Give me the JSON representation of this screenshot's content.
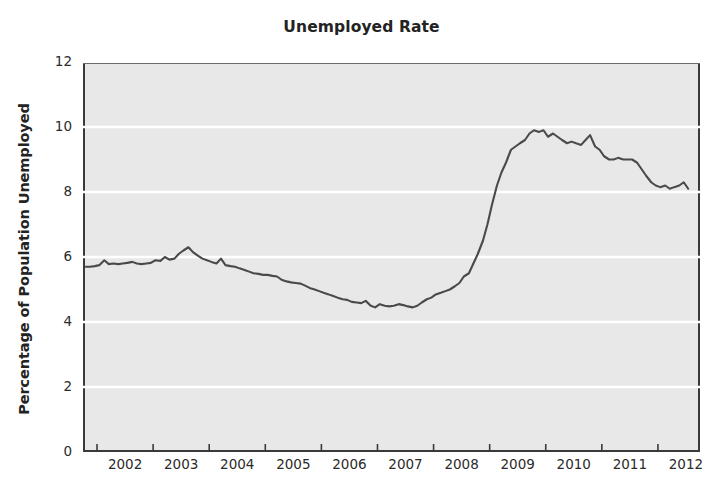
{
  "chart_data": {
    "type": "line",
    "title": "Unemployed Rate",
    "xlabel": "",
    "ylabel": "Percentage of Population Unemployed",
    "xlim": [
      2001.75,
      2012.75
    ],
    "ylim": [
      0,
      12
    ],
    "yticks": [
      0,
      2,
      4,
      6,
      8,
      10,
      12
    ],
    "xticks": [
      2002,
      2003,
      2004,
      2005,
      2006,
      2007,
      2008,
      2009,
      2010,
      2011,
      2012
    ],
    "xtick_labels": [
      "2002",
      "2003",
      "2004",
      "2005",
      "2006",
      "2007",
      "2008",
      "2009",
      "2010",
      "2011",
      "2012"
    ],
    "ytick_labels": [
      "0",
      "2",
      "4",
      "6",
      "8",
      "10",
      "12"
    ],
    "grid": "horizontal-white",
    "legend": "none",
    "plot_background": "#e8e8e8",
    "line_color": "#4a4a4a",
    "border_color": "#3a3a3a",
    "series": [
      {
        "name": "Unemployment rate",
        "x": [
          2001.8,
          2001.88,
          2001.96,
          2002.04,
          2002.13,
          2002.21,
          2002.29,
          2002.38,
          2002.46,
          2002.54,
          2002.63,
          2002.71,
          2002.79,
          2002.88,
          2002.96,
          2003.04,
          2003.13,
          2003.21,
          2003.29,
          2003.38,
          2003.46,
          2003.54,
          2003.63,
          2003.71,
          2003.79,
          2003.88,
          2003.96,
          2004.04,
          2004.13,
          2004.21,
          2004.29,
          2004.38,
          2004.46,
          2004.54,
          2004.63,
          2004.71,
          2004.79,
          2004.88,
          2004.96,
          2005.04,
          2005.13,
          2005.21,
          2005.29,
          2005.38,
          2005.46,
          2005.54,
          2005.63,
          2005.71,
          2005.79,
          2005.88,
          2005.96,
          2006.04,
          2006.13,
          2006.21,
          2006.29,
          2006.38,
          2006.46,
          2006.54,
          2006.63,
          2006.71,
          2006.79,
          2006.88,
          2006.96,
          2007.04,
          2007.13,
          2007.21,
          2007.29,
          2007.38,
          2007.46,
          2007.54,
          2007.63,
          2007.71,
          2007.79,
          2007.88,
          2007.96,
          2008.04,
          2008.13,
          2008.21,
          2008.29,
          2008.38,
          2008.46,
          2008.54,
          2008.63,
          2008.71,
          2008.79,
          2008.88,
          2008.96,
          2009.04,
          2009.13,
          2009.21,
          2009.29,
          2009.38,
          2009.46,
          2009.54,
          2009.63,
          2009.71,
          2009.79,
          2009.88,
          2009.96,
          2010.04,
          2010.13,
          2010.21,
          2010.29,
          2010.38,
          2010.46,
          2010.54,
          2010.63,
          2010.71,
          2010.79,
          2010.88,
          2010.96,
          2011.04,
          2011.13,
          2011.21,
          2011.29,
          2011.38,
          2011.46,
          2011.54,
          2011.63,
          2011.71,
          2011.79,
          2011.88,
          2011.96,
          2012.04,
          2012.13,
          2012.21,
          2012.29,
          2012.38,
          2012.46,
          2012.54
        ],
        "y": [
          5.7,
          5.7,
          5.72,
          5.75,
          5.9,
          5.78,
          5.8,
          5.78,
          5.8,
          5.82,
          5.85,
          5.8,
          5.78,
          5.8,
          5.82,
          5.9,
          5.88,
          6.0,
          5.92,
          5.95,
          6.1,
          6.2,
          6.3,
          6.15,
          6.05,
          5.95,
          5.9,
          5.85,
          5.8,
          5.95,
          5.75,
          5.72,
          5.7,
          5.65,
          5.6,
          5.55,
          5.5,
          5.48,
          5.45,
          5.45,
          5.42,
          5.4,
          5.3,
          5.25,
          5.22,
          5.2,
          5.18,
          5.12,
          5.05,
          5.0,
          4.95,
          4.9,
          4.85,
          4.8,
          4.75,
          4.7,
          4.68,
          4.62,
          4.6,
          4.58,
          4.65,
          4.5,
          4.45,
          4.55,
          4.5,
          4.48,
          4.5,
          4.55,
          4.52,
          4.48,
          4.45,
          4.5,
          4.6,
          4.7,
          4.75,
          4.85,
          4.9,
          4.95,
          5.0,
          5.1,
          5.2,
          5.4,
          5.5,
          5.8,
          6.1,
          6.5,
          7.0,
          7.6,
          8.2,
          8.6,
          8.9,
          9.3,
          9.4,
          9.5,
          9.6,
          9.8,
          9.9,
          9.85,
          9.9,
          9.7,
          9.8,
          9.7,
          9.6,
          9.5,
          9.55,
          9.5,
          9.45,
          9.6,
          9.75,
          9.4,
          9.3,
          9.1,
          9.0,
          9.0,
          9.05,
          9.0,
          9.0,
          9.0,
          8.9,
          8.7,
          8.5,
          8.3,
          8.2,
          8.15,
          8.2,
          8.1,
          8.15,
          8.2,
          8.3,
          8.1
        ]
      }
    ]
  }
}
